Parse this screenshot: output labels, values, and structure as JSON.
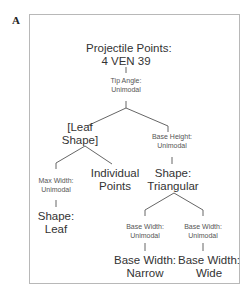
{
  "panel_label": "A",
  "tree": {
    "root": {
      "line1": "Projectile Points:",
      "line2": "4 VEN 39"
    },
    "tip_angle": {
      "line1": "Tip Angle:",
      "line2": "Unimodal"
    },
    "leaf_shape": {
      "line1": "[Leaf",
      "line2": "Shape]"
    },
    "base_height": {
      "line1": "Base Height:",
      "line2": "Unimodal"
    },
    "max_width": {
      "line1": "Max Width:",
      "line2": "Unimodal"
    },
    "individual_points": {
      "line1": "Individual",
      "line2": "Points"
    },
    "shape_triangular": {
      "line1": "Shape:",
      "line2": "Triangular"
    },
    "shape_leaf": {
      "line1": "Shape:",
      "line2": "Leaf"
    },
    "base_width_left": {
      "line1": "Base Width:",
      "line2": "Unimodal"
    },
    "base_width_right": {
      "line1": "Base Width:",
      "line2": "Unimodal"
    },
    "base_width_narrow": {
      "line1": "Base Width:",
      "line2": "Narrow"
    },
    "base_width_wide": {
      "line1": "Base Width:",
      "line2": "Wide"
    }
  }
}
